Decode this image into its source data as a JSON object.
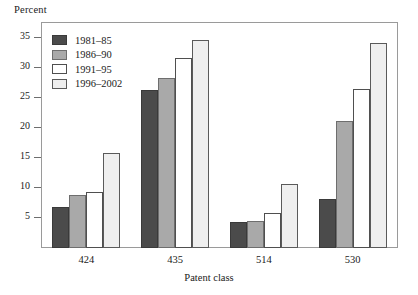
{
  "chart_data": {
    "type": "bar",
    "title": "",
    "subtitle": "",
    "ylabel": "Percent",
    "xlabel": "Patent class",
    "categories": [
      "424",
      "435",
      "514",
      "530"
    ],
    "series": [
      {
        "name": "1981–85",
        "color": "#4b4b4b",
        "values": [
          6.8,
          26.4,
          4.4,
          8.2
        ]
      },
      {
        "name": "1986–90",
        "color": "#a9a9a9",
        "values": [
          8.8,
          28.4,
          4.5,
          21.2
        ]
      },
      {
        "name": "1991–95",
        "color": "#ffffff",
        "values": [
          9.3,
          31.6,
          5.9,
          26.5
        ]
      },
      {
        "name": "1996–2002",
        "color": "#efefef",
        "values": [
          15.8,
          34.6,
          10.6,
          34.2
        ]
      }
    ],
    "ylim": [
      0,
      37.5
    ],
    "yticks": [
      5,
      10,
      15,
      20,
      25,
      30,
      35
    ],
    "ytick_labels": [
      "5",
      "10",
      "15",
      "20",
      "25",
      "30",
      "35"
    ],
    "grid": false,
    "legend_position": "top-left",
    "frame": true
  },
  "legend": {
    "entries": [
      {
        "label": "1981–85"
      },
      {
        "label": "1986–90"
      },
      {
        "label": "1991–95"
      },
      {
        "label": "1996–2002"
      }
    ]
  }
}
